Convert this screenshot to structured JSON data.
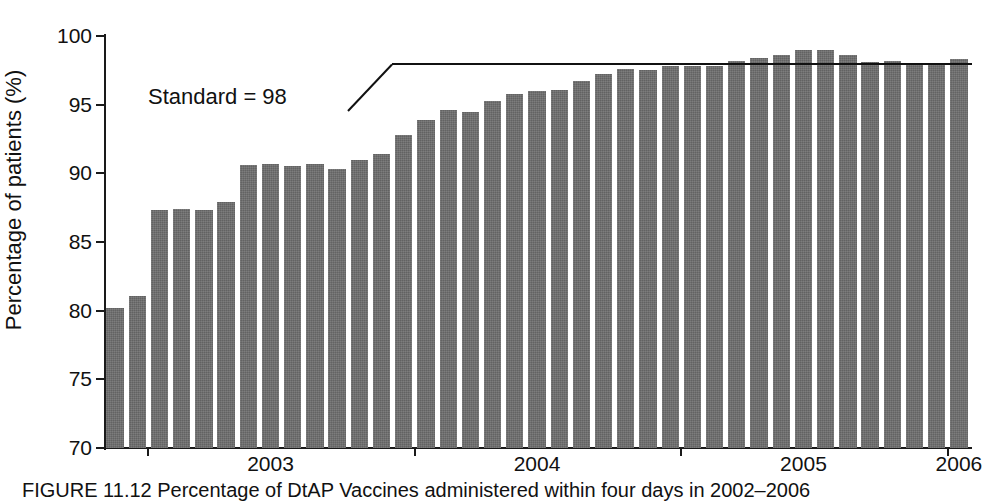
{
  "chart_data": {
    "type": "bar",
    "title": "",
    "xlabel": "",
    "ylabel": "Percentage of patients (%)",
    "ylim": [
      70,
      100
    ],
    "ytick_labels": [
      "70",
      "75",
      "80",
      "85",
      "90",
      "95",
      "100"
    ],
    "ytick_values": [
      70,
      75,
      80,
      85,
      90,
      95,
      100
    ],
    "grid": false,
    "legend": "none",
    "bar_color": "#6e6e6e",
    "categories": [
      "2002-11",
      "2002-12",
      "2003-01",
      "2003-02",
      "2003-03",
      "2003-04",
      "2003-05",
      "2003-06",
      "2003-07",
      "2003-08",
      "2003-09",
      "2003-10",
      "2003-11",
      "2003-12",
      "2004-01",
      "2004-02",
      "2004-03",
      "2004-04",
      "2004-05",
      "2004-06",
      "2004-07",
      "2004-08",
      "2004-09",
      "2004-10",
      "2004-11",
      "2004-12",
      "2005-01",
      "2005-02",
      "2005-03",
      "2005-04",
      "2005-05",
      "2005-06",
      "2005-07",
      "2005-08",
      "2005-09",
      "2005-10",
      "2005-11",
      "2005-12",
      "2006-01"
    ],
    "values": [
      80.2,
      81.1,
      87.3,
      87.4,
      87.3,
      87.9,
      90.6,
      90.7,
      90.5,
      90.7,
      90.3,
      91.0,
      91.4,
      92.8,
      93.9,
      94.6,
      94.5,
      95.3,
      95.8,
      96.0,
      96.1,
      96.7,
      97.2,
      97.6,
      97.5,
      97.8,
      97.8,
      97.8,
      98.2,
      98.4,
      98.6,
      99.0,
      99.0,
      98.6,
      98.1,
      98.2,
      97.9,
      97.9,
      98.3
    ],
    "x_axis_groups": [
      {
        "label": "2003",
        "center_category": "2003-06"
      },
      {
        "label": "2004",
        "center_category": "2004-06"
      },
      {
        "label": "2005",
        "center_category": "2005-06"
      },
      {
        "label": "2006",
        "center_category": "2006-01"
      }
    ],
    "reference_line": {
      "label": "Standard = 98",
      "value": 98,
      "annotation_text": "Standard = 98"
    }
  },
  "axis": {
    "y_title": "Percentage of patients (%)",
    "year_labels": [
      "2003",
      "2004",
      "2005",
      "2006"
    ]
  },
  "annotation": {
    "standard_label": "Standard = 98"
  },
  "caption": {
    "text": "FIGURE 11.12   Percentage of DtAP Vaccines administered within four days in 2002–2006"
  }
}
